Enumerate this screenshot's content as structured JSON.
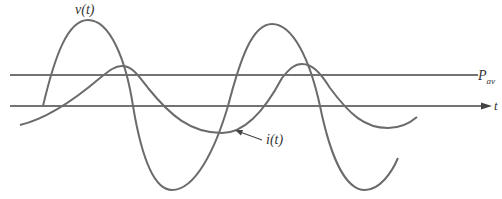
{
  "diagram": {
    "title": "",
    "labels": {
      "voltage": "v(t)",
      "current": "i(t)",
      "average_power": "P",
      "average_power_sub": "av",
      "time_axis": "t"
    },
    "colors": {
      "curve": "#6b6b6b",
      "axis": "#444444",
      "text": "#333333",
      "background": "#ffffff"
    },
    "elements": [
      {
        "name": "time-axis",
        "type": "arrow",
        "from": [
          10,
          106
        ],
        "to": [
          490,
          106
        ]
      },
      {
        "name": "average-power-line",
        "type": "line",
        "from": [
          10,
          75
        ],
        "to": [
          478,
          75
        ]
      },
      {
        "name": "voltage-curve",
        "type": "sinusoid",
        "description": "larger amplitude wave, leads current"
      },
      {
        "name": "current-curve",
        "type": "sinusoid",
        "description": "smaller amplitude wave, lags voltage"
      }
    ]
  }
}
